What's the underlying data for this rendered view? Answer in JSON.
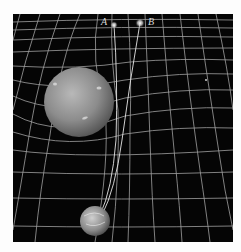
{
  "figure": {
    "background_color": "#050505",
    "grid_color": "#cfcfcf",
    "labels": {
      "image_a": "A",
      "image_b": "B"
    },
    "objects": [
      {
        "name": "lensing-planet",
        "description": "large mottled gray planet warping the grid",
        "cx": 79,
        "cy": 102,
        "r": 35
      },
      {
        "name": "observer-planet",
        "description": "small Earth-like planet at bottom",
        "cx": 95,
        "cy": 221,
        "r": 15
      },
      {
        "name": "star-image-a",
        "cx": 114,
        "cy": 25
      },
      {
        "name": "star-image-b",
        "cx": 140,
        "cy": 23
      }
    ]
  }
}
